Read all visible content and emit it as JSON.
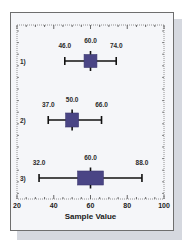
{
  "chart_data": {
    "type": "box",
    "orientation": "horizontal",
    "title": "",
    "xlabel": "Sample Value",
    "ylabel": "",
    "xlim": [
      20,
      100
    ],
    "x_ticks": [
      20,
      40,
      60,
      80,
      100
    ],
    "x_tick_labels": [
      "20",
      "40",
      "60",
      "80",
      "100"
    ],
    "minor_tick_step": 5,
    "grid": false,
    "legend": null,
    "box_color": "#4a4585",
    "categories": [
      "1)",
      "2)",
      "3)"
    ],
    "series": [
      {
        "name": "1)",
        "min": 46.0,
        "q1": 56.5,
        "median": 60.0,
        "q3": 63.5,
        "max": 74.0,
        "labels": {
          "min": "46.0",
          "median": "60.0",
          "max": "74.0"
        }
      },
      {
        "name": "2)",
        "min": 37.0,
        "q1": 46.5,
        "median": 50.0,
        "q3": 53.5,
        "max": 66.0,
        "labels": {
          "min": "37.0",
          "median": "50.0",
          "max": "66.0"
        }
      },
      {
        "name": "3)",
        "min": 32.0,
        "q1": 53.0,
        "median": 60.0,
        "q3": 67.0,
        "max": 88.0,
        "labels": {
          "min": "32.0",
          "median": "60.0",
          "max": "88.0"
        }
      }
    ]
  }
}
